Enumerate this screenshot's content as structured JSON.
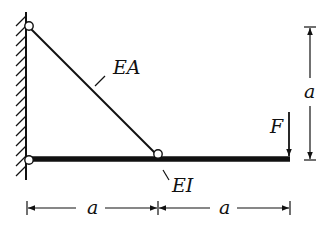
{
  "diagram": {
    "type": "structural-mechanics",
    "colors": {
      "stroke": "#111111",
      "background": "#ffffff"
    },
    "labels": {
      "bar": "EA",
      "beam": "EI",
      "force": "F",
      "dim_vertical": "a",
      "dim_left": "a",
      "dim_right": "a"
    },
    "elements": [
      {
        "id": "wall",
        "kind": "fixed-wall-hatched"
      },
      {
        "id": "hinge-top",
        "kind": "pin",
        "at": "wall top"
      },
      {
        "id": "hinge-bottom",
        "kind": "pin",
        "at": "wall beam support"
      },
      {
        "id": "hinge-mid",
        "kind": "pin",
        "at": "beam midpoint"
      },
      {
        "id": "bar",
        "kind": "truss-bar",
        "label": "EA"
      },
      {
        "id": "beam",
        "kind": "beam",
        "label": "EI"
      },
      {
        "id": "force",
        "kind": "point-load-downward",
        "label": "F"
      }
    ]
  }
}
